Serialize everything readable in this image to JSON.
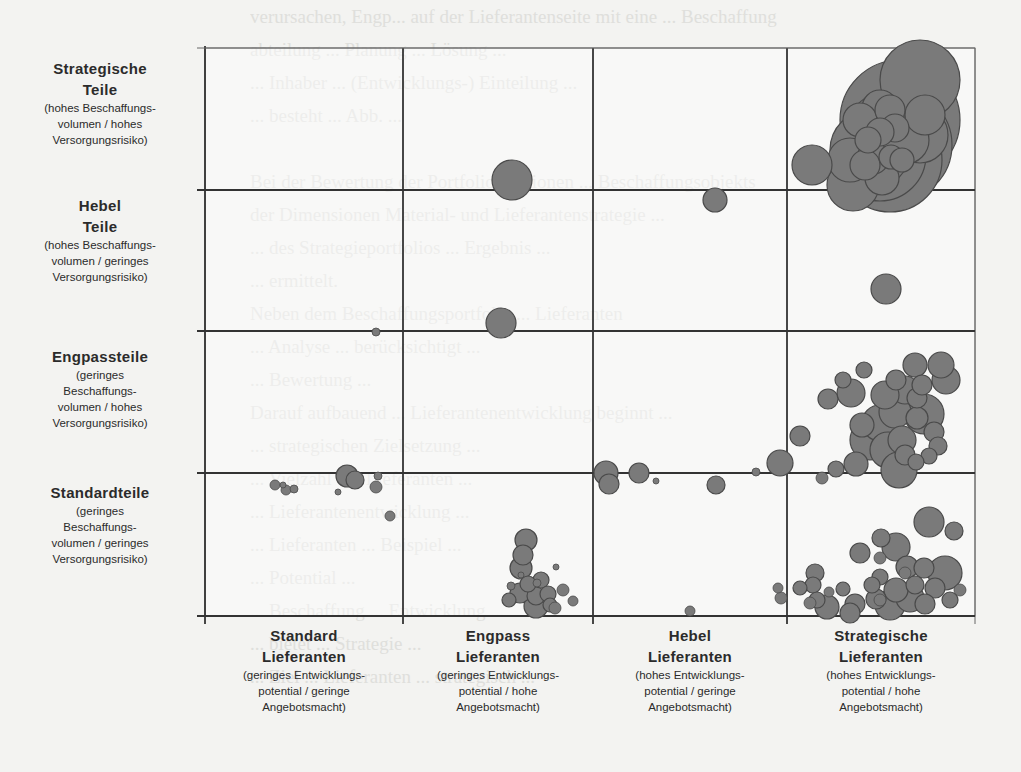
{
  "chart_data": {
    "type": "scatter",
    "subtype": "bubble-portfolio-matrix",
    "title": "",
    "xlabel": "Lieferanten",
    "ylabel": "Teile",
    "grid": true,
    "legend": null,
    "x_categories": [
      {
        "title": "Standard",
        "title2": "Lieferanten",
        "sub": [
          "(geringes Entwicklungs-",
          "potential / geringe",
          "Angebotsmacht)"
        ]
      },
      {
        "title": "Engpass",
        "title2": "Lieferanten",
        "sub": [
          "(geringes Entwicklungs-",
          "potential / hohe",
          "Angebotsmacht)"
        ]
      },
      {
        "title": "Hebel",
        "title2": "Lieferanten",
        "sub": [
          "(hohes Entwicklungs-",
          "potential / geringe",
          "Angebotsmacht)"
        ]
      },
      {
        "title": "Strategische",
        "title2": "Lieferanten",
        "sub": [
          "(hohes Entwicklungs-",
          "potential / hohe",
          "Angebotsmacht)"
        ]
      }
    ],
    "y_categories": [
      {
        "title": "Strategische",
        "title2": "Teile",
        "sub": [
          "(hohes Beschaffungs-",
          "volumen / hohes",
          "Versorgungsrisiko)"
        ]
      },
      {
        "title": "Hebel",
        "title2": "Teile",
        "sub": [
          "(hohes Beschaffungs-",
          "volumen / geringes",
          "Versorgungsrisiko)"
        ]
      },
      {
        "title": "Engpassteile",
        "title2": "",
        "sub": [
          "(geringes",
          "Beschaffungs-",
          "volumen / hohes",
          "Versorgungsrisiko)"
        ]
      },
      {
        "title": "Standardteile",
        "title2": "",
        "sub": [
          "(geringes",
          "Beschaffungs-",
          "volumen / geringes",
          "Versorgungsrisiko)"
        ]
      }
    ],
    "bubble_color": "#7a7a7a",
    "bubble_stroke": "#4a4a4a",
    "grid_px": {
      "x": [
        205,
        403,
        593,
        787,
        975
      ],
      "y": [
        48,
        190,
        331,
        473,
        616
      ]
    },
    "bubbles_px": [
      [
        920,
        80,
        40
      ],
      [
        900,
        120,
        60
      ],
      [
        896,
        145,
        56
      ],
      [
        890,
        160,
        52
      ],
      [
        880,
        155,
        46
      ],
      [
        870,
        150,
        40
      ],
      [
        880,
        108,
        18
      ],
      [
        860,
        120,
        17
      ],
      [
        890,
        110,
        15
      ],
      [
        925,
        115,
        20
      ],
      [
        920,
        135,
        28
      ],
      [
        905,
        140,
        24
      ],
      [
        895,
        128,
        14
      ],
      [
        880,
        132,
        14
      ],
      [
        868,
        140,
        13
      ],
      [
        873,
        158,
        16
      ],
      [
        891,
        157,
        12
      ],
      [
        902,
        160,
        12
      ],
      [
        882,
        178,
        17
      ],
      [
        865,
        165,
        15
      ],
      [
        850,
        160,
        22
      ],
      [
        853,
        185,
        26
      ],
      [
        812,
        165,
        20
      ],
      [
        512,
        180,
        20
      ],
      [
        715,
        200,
        12
      ],
      [
        886,
        289,
        15
      ],
      [
        501,
        323,
        15
      ],
      [
        376,
        332,
        4
      ],
      [
        864,
        370,
        8
      ],
      [
        851,
        393,
        14
      ],
      [
        843,
        380,
        8
      ],
      [
        828,
        399,
        10
      ],
      [
        896,
        380,
        10
      ],
      [
        905,
        390,
        14
      ],
      [
        885,
        395,
        14
      ],
      [
        895,
        412,
        16
      ],
      [
        880,
        423,
        18
      ],
      [
        862,
        425,
        12
      ],
      [
        870,
        440,
        20
      ],
      [
        902,
        440,
        14
      ],
      [
        888,
        450,
        18
      ],
      [
        905,
        455,
        10
      ],
      [
        917,
        418,
        11
      ],
      [
        924,
        414,
        20
      ],
      [
        915,
        365,
        12
      ],
      [
        917,
        398,
        10
      ],
      [
        922,
        385,
        10
      ],
      [
        941,
        365,
        13
      ],
      [
        946,
        380,
        14
      ],
      [
        934,
        432,
        10
      ],
      [
        938,
        446,
        9
      ],
      [
        929,
        456,
        8
      ],
      [
        916,
        462,
        8
      ],
      [
        899,
        470,
        18
      ],
      [
        856,
        464,
        12
      ],
      [
        836,
        469,
        8
      ],
      [
        822,
        478,
        6
      ],
      [
        800,
        436,
        10
      ],
      [
        780,
        463,
        13
      ],
      [
        606,
        473,
        12
      ],
      [
        609,
        484,
        10
      ],
      [
        639,
        473,
        10
      ],
      [
        716,
        485,
        9
      ],
      [
        756,
        472,
        4
      ],
      [
        656,
        481,
        3
      ],
      [
        275,
        485,
        5
      ],
      [
        283,
        485,
        3
      ],
      [
        286,
        490,
        5
      ],
      [
        294,
        489,
        4
      ],
      [
        347,
        476,
        11
      ],
      [
        355,
        480,
        9
      ],
      [
        378,
        476,
        4
      ],
      [
        376,
        487,
        6
      ],
      [
        338,
        492,
        3
      ],
      [
        390,
        516,
        5
      ],
      [
        526,
        540,
        11
      ],
      [
        523,
        555,
        10
      ],
      [
        521,
        568,
        11
      ],
      [
        541,
        580,
        8
      ],
      [
        528,
        584,
        8
      ],
      [
        556,
        567,
        3
      ],
      [
        520,
        593,
        10
      ],
      [
        536,
        596,
        9
      ],
      [
        548,
        594,
        8
      ],
      [
        536,
        606,
        12
      ],
      [
        563,
        590,
        6
      ],
      [
        573,
        601,
        5
      ],
      [
        550,
        605,
        7
      ],
      [
        511,
        586,
        4
      ],
      [
        509,
        600,
        7
      ],
      [
        537,
        583,
        4
      ],
      [
        521,
        575,
        3
      ],
      [
        555,
        608,
        6
      ],
      [
        690,
        611,
        5
      ],
      [
        929,
        522,
        15
      ],
      [
        954,
        531,
        9
      ],
      [
        881,
        538,
        9
      ],
      [
        896,
        547,
        14
      ],
      [
        860,
        553,
        10
      ],
      [
        880,
        558,
        6
      ],
      [
        907,
        567,
        11
      ],
      [
        924,
        568,
        10
      ],
      [
        945,
        573,
        17
      ],
      [
        960,
        590,
        6
      ],
      [
        880,
        577,
        8
      ],
      [
        815,
        573,
        9
      ],
      [
        813,
        585,
        8
      ],
      [
        843,
        589,
        7
      ],
      [
        872,
        585,
        8
      ],
      [
        896,
        590,
        12
      ],
      [
        915,
        585,
        9
      ],
      [
        935,
        588,
        10
      ],
      [
        950,
        600,
        8
      ],
      [
        910,
        598,
        14
      ],
      [
        890,
        605,
        15
      ],
      [
        876,
        599,
        10
      ],
      [
        925,
        604,
        10
      ],
      [
        855,
        604,
        10
      ],
      [
        800,
        588,
        7
      ],
      [
        817,
        600,
        8
      ],
      [
        829,
        592,
        5
      ],
      [
        810,
        603,
        6
      ],
      [
        827,
        607,
        12
      ],
      [
        850,
        613,
        10
      ],
      [
        778,
        588,
        5
      ],
      [
        781,
        598,
        6
      ],
      [
        905,
        573,
        6
      ],
      [
        880,
        600,
        6
      ]
    ]
  },
  "background_text": "verursachen, Engp... auf der Lieferantenseite mit eine ... Beschaffung\nabteilung ... Planung ... Lösung ...\n... Inhaber ... (Entwicklungs-) Einteilung ...\n... besteht ... Abb. ...\n\nBei der Bewertung der Portfoliopositionen ... Beschaffungsobjekts\nder Dimensionen Material- und Lieferantenstrategie ...\n... des Strategieportfolios ... Ergebnis ...\n... ermittelt.\nNeben dem Beschaffungsportfolio ... Lieferanten\n... Analyse ... berücksichtigt ...\n... Bewertung ...\nDarauf aufbauend ... Lieferantenentwicklung beginnt ...\n... strategischen Zielsetzung ...\n... Vielzahl der Lieferanten ...\n... Lieferantenentwicklung ...\n... Lieferanten ... Beispiel ...\n... Potential ...\n... Beschaffung ... Entwicklung ...\n... bietet ... Strategie ...\n... Ziel ... Lieferanten ... strategisch ..."
}
